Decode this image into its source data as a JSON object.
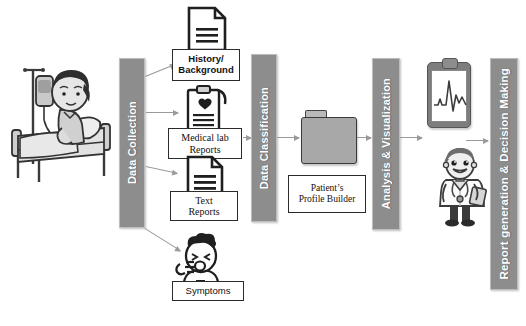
{
  "diagram": {
    "stage_bars": [
      {
        "id": "data-collection",
        "label": "Data Collection"
      },
      {
        "id": "data-classification",
        "label": "Data Classification"
      },
      {
        "id": "analysis-visualization",
        "label": "Analysis & Visualization"
      },
      {
        "id": "report-decision",
        "label": "Report generation & Decision Making"
      }
    ],
    "input_boxes": [
      {
        "id": "history",
        "line1": "History/",
        "line2": "Background",
        "icon": "document-icon"
      },
      {
        "id": "medical",
        "line1": "Medical lab",
        "line2": "Reports",
        "icon": "clipboard-report-icon"
      },
      {
        "id": "text",
        "line1": "Text",
        "line2": "Reports",
        "icon": "document-icon"
      },
      {
        "id": "symptoms",
        "line1": "Symptoms",
        "line2": "",
        "icon": "coughing-patient-icon"
      }
    ],
    "profile_box": {
      "line1": "Patient’s",
      "line2": "Profile Builder",
      "icon": "folder-icon"
    },
    "figures": [
      {
        "id": "patient-in-bed",
        "icon": "patient-hospital-bed-icon"
      },
      {
        "id": "ecg-clipboard",
        "icon": "ecg-clipboard-icon"
      },
      {
        "id": "doctor",
        "icon": "doctor-icon"
      }
    ],
    "colors": {
      "bar_fill": "#8d8d8d",
      "bar_text": "#ffffff",
      "box_border": "#2b2b2b",
      "arrow": "#9a9a9a",
      "background": "#ffffff"
    }
  }
}
